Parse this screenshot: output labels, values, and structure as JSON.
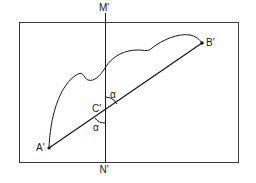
{
  "diagram": {
    "labels": {
      "top": "M'",
      "bottom": "N'",
      "point_a": "A'",
      "point_b": "B'",
      "point_c": "C'",
      "angle_upper": "α",
      "angle_lower": "α"
    },
    "colors": {
      "stroke": "#1a1a1a",
      "background": "#ffffff"
    }
  }
}
